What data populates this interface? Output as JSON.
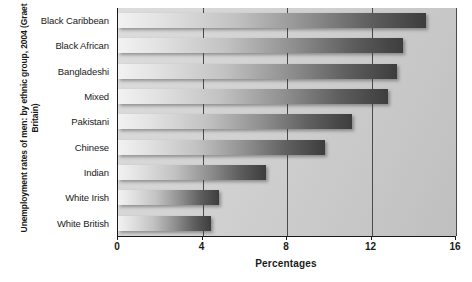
{
  "chart_data": {
    "type": "bar",
    "orientation": "horizontal",
    "title": "Unemployment rates of men: by ethnic group, 2004 (Graet Britain)",
    "xlabel": "Percentages",
    "ylabel": "Unemployment rates of men: by ethnic group, 2004 (Graet Britain)",
    "categories": [
      "Black Caribbean",
      "Black African",
      "Bangladeshi",
      "Mixed",
      "Pakistani",
      "Chinese",
      "Indian",
      "White Irish",
      "White British"
    ],
    "values": [
      14.6,
      13.5,
      13.2,
      12.8,
      11.1,
      9.8,
      7.0,
      4.8,
      4.4
    ],
    "xlim": [
      0,
      16
    ],
    "xticks": [
      0,
      4,
      8,
      12,
      16
    ],
    "xtick_labels": [
      "0",
      "4",
      "8",
      "12",
      "16"
    ],
    "grid": "vertical",
    "legend": null,
    "bar_fill": "gradient-light-to-dark-gray",
    "plot_background": "#d3d3d3"
  },
  "colors": {
    "axis": "#1a1a1a",
    "text": "#1a1a1a",
    "plot_bg": "#d3d3d3",
    "gridline": "#4a4a4a",
    "bar_light": "#f2f2f2",
    "bar_dark": "#3d3d3d"
  }
}
